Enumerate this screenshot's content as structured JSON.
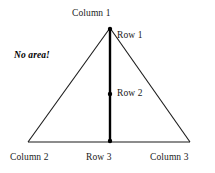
{
  "figure": {
    "title_text": "",
    "background_color": "#ffffff",
    "stroke_color": "#1a1a1a",
    "thick_stroke_color": "#000000"
  },
  "labels": {
    "column_1": "Column 1",
    "row_1": "Row 1",
    "no_area": "No area!",
    "row_2": "Row 2",
    "column_2": "Column 2",
    "row_3": "Row 3",
    "column_3": "Column 3"
  },
  "geometry": {
    "apex": {
      "x": 110,
      "y": 28
    },
    "base_left": {
      "x": 28,
      "y": 142
    },
    "base_right": {
      "x": 190,
      "y": 142
    },
    "midpoint_marker": {
      "x": 110,
      "y": 94
    }
  }
}
